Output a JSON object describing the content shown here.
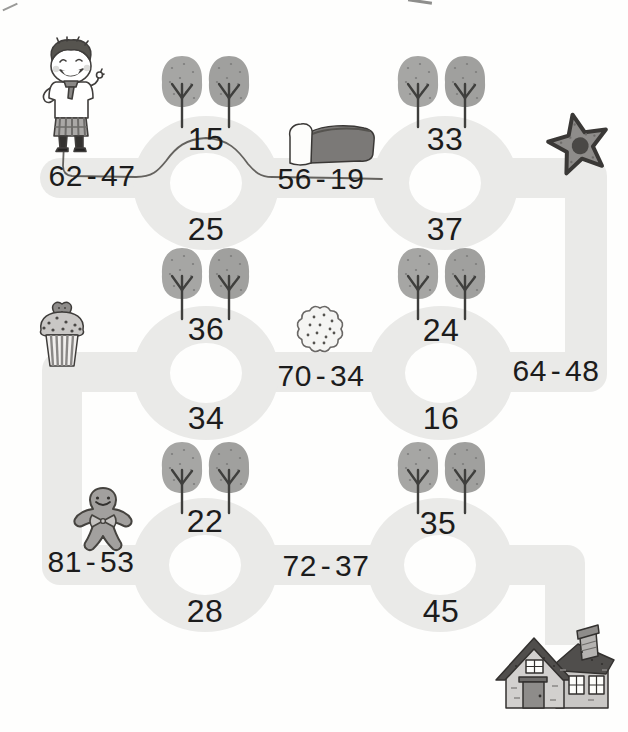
{
  "worksheet": {
    "equations": {
      "eq1": "62 - 47",
      "eq2": "56 - 19",
      "eq3": "64 - 48",
      "eq4": "70 - 34",
      "eq5": "81 - 53",
      "eq6": "72 - 37"
    },
    "rings": {
      "r1": {
        "top": "15",
        "bottom": "25"
      },
      "r2": {
        "top": "33",
        "bottom": "37"
      },
      "r3": {
        "top": "36",
        "bottom": "34"
      },
      "r4": {
        "top": "24",
        "bottom": "16"
      },
      "r5": {
        "top": "22",
        "bottom": "28"
      },
      "r6": {
        "top": "35",
        "bottom": "45"
      }
    },
    "trace": {
      "drawn_through": [
        "62 - 47",
        "15",
        "56 - 19"
      ]
    },
    "icons": {
      "start": "boy-icon",
      "goal": "house-icon",
      "landmarks": [
        "bread-icon",
        "star-icon",
        "cookie-icon",
        "cupcake-icon",
        "gingerbread-man-icon"
      ],
      "decoration": "tree-pair-icon"
    },
    "colors": {
      "track": "#eaeae8",
      "text": "#1c1c1c",
      "foliage": "#a3a3a1",
      "trace": "#55534f"
    }
  }
}
